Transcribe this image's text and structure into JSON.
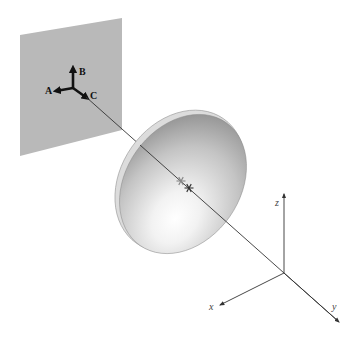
{
  "diagram": {
    "type": "3d-optics-schematic",
    "screen": {
      "label": "image plane",
      "color": "#b9b9b9",
      "corners": [
        [
          20,
          35
        ],
        [
          122,
          18
        ],
        [
          122,
          130
        ],
        [
          20,
          156
        ]
      ]
    },
    "triad": {
      "origin": [
        73,
        88
      ],
      "arrows": [
        {
          "id": "A",
          "label": "A",
          "tip": [
            56,
            91
          ]
        },
        {
          "id": "B",
          "label": "B",
          "tip": [
            73,
            68
          ]
        },
        {
          "id": "C",
          "label": "C",
          "tip": [
            87,
            98
          ]
        }
      ]
    },
    "dish": {
      "center": [
        183,
        184
      ],
      "rx": 57,
      "ry": 75,
      "rotation": 35,
      "color_light": "#ffffff",
      "color_dark": "#8c8c8c",
      "rim_color": "#dcdcdc"
    },
    "ray": {
      "from": [
        86,
        97
      ],
      "to": [
        338,
        321
      ],
      "color": "#333333"
    },
    "markers": [
      {
        "name": "focal-marker-1",
        "pos": [
          181,
          181
        ],
        "color": "#888888"
      },
      {
        "name": "focal-marker-2",
        "pos": [
          189,
          188
        ],
        "color": "#333333"
      }
    ],
    "axes": {
      "origin": [
        284,
        273
      ],
      "x": {
        "label": "x",
        "tip": [
          220,
          305
        ],
        "label_pos": [
          209,
          310
        ]
      },
      "y": {
        "label": "y",
        "tip": [
          339,
          322
        ],
        "label_pos": [
          332,
          310
        ]
      },
      "z": {
        "label": "z",
        "tip": [
          284,
          194
        ],
        "label_pos": [
          275,
          206
        ]
      }
    }
  }
}
